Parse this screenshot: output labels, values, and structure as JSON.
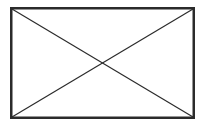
{
  "placeholder": {
    "icon": "image-placeholder-icon",
    "stroke_color": "#2b2b2b",
    "background": "#ffffff"
  }
}
